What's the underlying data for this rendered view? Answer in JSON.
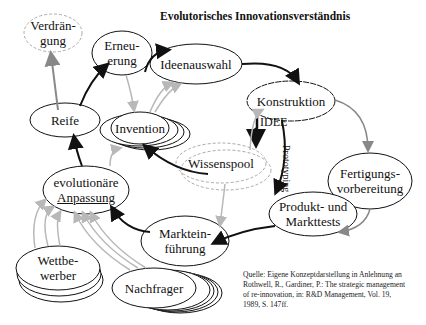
{
  "title": "Evolutorisches Innovationsverständnis",
  "nodes": {
    "verdraengung": {
      "line1": "Verdrän-",
      "line2": "gung"
    },
    "erneuerung": {
      "line1": "Erneu-",
      "line2": "erung"
    },
    "ideenauswahl": {
      "label": "Ideenauswahl"
    },
    "reife": {
      "label": "Reife"
    },
    "invention": {
      "label": "Invention"
    },
    "konstruktion": {
      "label": "Konstruktion"
    },
    "idee": {
      "label": "IDEE"
    },
    "wissenspool": {
      "label": "Wissenspool"
    },
    "fertigung": {
      "line1": "Fertigungs-",
      "line2": "vorbereitung"
    },
    "evolutionaere": {
      "line1": "evolutionäre",
      "line2": "Anpassung"
    },
    "produkt": {
      "line1": "Produkt- und",
      "line2": "Markttests"
    },
    "markteinfuehrung": {
      "line1": "Marktein-",
      "line2": "führung"
    },
    "wettbewerber": {
      "line1": "Wettbe-",
      "line2": "werber"
    },
    "nachfrager": {
      "label": "Nachfrager"
    }
  },
  "edge_labels": {
    "prototyping": "Prototyping"
  },
  "source": {
    "line1": "Quelle: Eigene Konzeptdarstellung in Anlehnung an",
    "line2": "Rothwell, R., Gardiner, P.: The strategic management",
    "line3": "of  re-innovation, in: R&D Management, Vol. 19,",
    "line4": "1989,  S. 147ff."
  },
  "colors": {
    "stroke": "#111111",
    "gray_arrow": "#b8b8b8",
    "dashed": "#aaaaaa"
  }
}
